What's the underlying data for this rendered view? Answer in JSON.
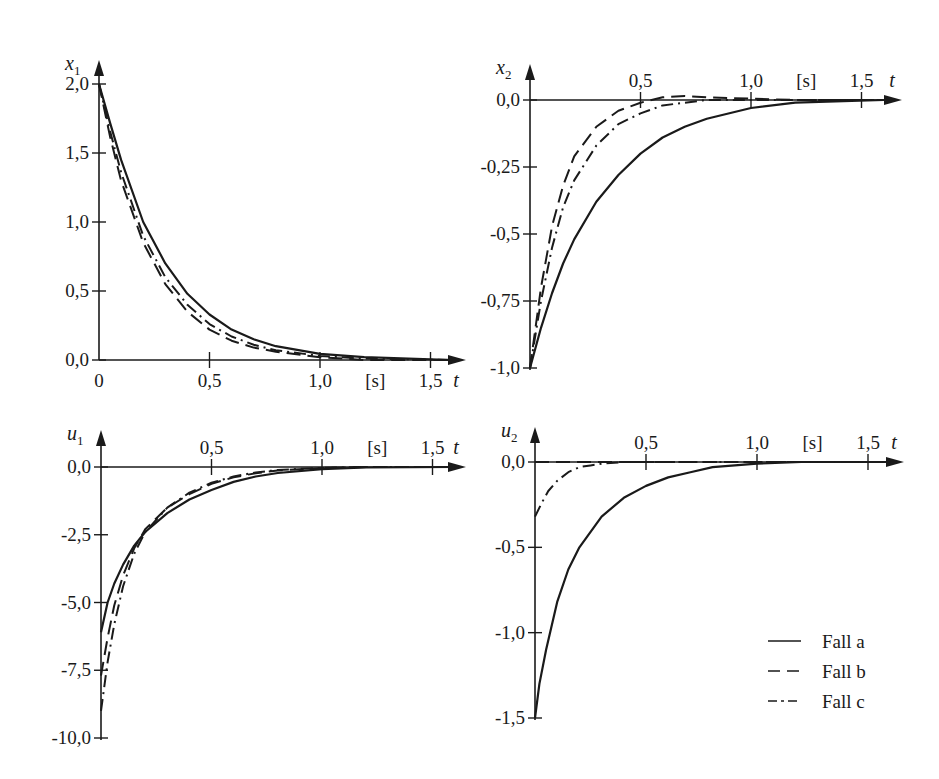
{
  "chart_data": [
    {
      "type": "line",
      "panel": "top-left",
      "ylabel": "x1",
      "ylabel_var": "x",
      "ylabel_sub": "1",
      "xlabel": "t",
      "xunit": "[s]",
      "xlim": [
        0,
        1.6
      ],
      "ylim": [
        0,
        2.0
      ],
      "xticks": [
        "0",
        "0,5",
        "1,0",
        "1,5"
      ],
      "xtick_values": [
        0,
        0.5,
        1.0,
        1.5
      ],
      "yticks": [
        "0,0",
        "0,5",
        "1,0",
        "1,5",
        "2,0"
      ],
      "ytick_values": [
        0,
        0.5,
        1.0,
        1.5,
        2.0
      ],
      "x_tick_labels_position": "below",
      "series": [
        {
          "name": "Fall a",
          "style": "solid",
          "x": [
            0,
            0.05,
            0.1,
            0.2,
            0.3,
            0.4,
            0.5,
            0.6,
            0.7,
            0.8,
            1.0,
            1.2,
            1.6
          ],
          "values": [
            2.0,
            1.72,
            1.45,
            1.0,
            0.7,
            0.48,
            0.33,
            0.22,
            0.15,
            0.1,
            0.045,
            0.02,
            0.0
          ]
        },
        {
          "name": "Fall b",
          "style": "dashed",
          "x": [
            0,
            0.05,
            0.1,
            0.2,
            0.3,
            0.4,
            0.5,
            0.6,
            0.7,
            0.8,
            1.0,
            1.2,
            1.6
          ],
          "values": [
            2.0,
            1.62,
            1.3,
            0.85,
            0.55,
            0.35,
            0.22,
            0.14,
            0.09,
            0.06,
            0.02,
            0.0,
            0.0
          ]
        },
        {
          "name": "Fall c",
          "style": "dash-dot",
          "x": [
            0,
            0.05,
            0.1,
            0.2,
            0.3,
            0.4,
            0.5,
            0.6,
            0.7,
            0.8,
            1.0,
            1.2,
            1.6
          ],
          "values": [
            2.0,
            1.66,
            1.36,
            0.9,
            0.6,
            0.4,
            0.26,
            0.17,
            0.11,
            0.07,
            0.03,
            0.01,
            0.0
          ]
        }
      ]
    },
    {
      "type": "line",
      "panel": "top-right",
      "ylabel": "x2",
      "ylabel_var": "x",
      "ylabel_sub": "2",
      "xlabel": "t",
      "xunit": "[s]",
      "xlim": [
        0,
        1.6
      ],
      "ylim": [
        -1.0,
        0.0
      ],
      "xticks": [
        "0,5",
        "1,0",
        "1,5"
      ],
      "xtick_values": [
        0.5,
        1.0,
        1.5
      ],
      "yticks": [
        "0,0",
        "-0,25",
        "-0,5",
        "-0,75",
        "-1,0"
      ],
      "ytick_values": [
        0,
        -0.25,
        -0.5,
        -0.75,
        -1.0
      ],
      "x_tick_labels_position": "above",
      "series": [
        {
          "name": "Fall a",
          "style": "solid",
          "x": [
            0,
            0.05,
            0.1,
            0.15,
            0.2,
            0.3,
            0.4,
            0.5,
            0.6,
            0.7,
            0.8,
            1.0,
            1.2,
            1.6
          ],
          "values": [
            -1.0,
            -0.85,
            -0.72,
            -0.61,
            -0.52,
            -0.38,
            -0.28,
            -0.2,
            -0.14,
            -0.1,
            -0.07,
            -0.03,
            -0.01,
            0.0
          ]
        },
        {
          "name": "Fall b",
          "style": "dashed",
          "x": [
            0,
            0.05,
            0.1,
            0.15,
            0.2,
            0.3,
            0.4,
            0.5,
            0.6,
            0.7,
            0.8,
            1.0,
            1.2,
            1.6
          ],
          "values": [
            -1.0,
            -0.7,
            -0.47,
            -0.32,
            -0.21,
            -0.1,
            -0.04,
            -0.01,
            0.01,
            0.015,
            0.01,
            0.005,
            0.0,
            0.0
          ]
        },
        {
          "name": "Fall c",
          "style": "dash-dot",
          "x": [
            0,
            0.05,
            0.1,
            0.15,
            0.2,
            0.3,
            0.4,
            0.5,
            0.6,
            0.7,
            0.8,
            1.0,
            1.2,
            1.6
          ],
          "values": [
            -1.0,
            -0.75,
            -0.55,
            -0.4,
            -0.3,
            -0.17,
            -0.09,
            -0.05,
            -0.02,
            -0.01,
            0.0,
            0.0,
            0.0,
            0.0
          ]
        }
      ]
    },
    {
      "type": "line",
      "panel": "bottom-left",
      "ylabel": "u1",
      "ylabel_var": "u",
      "ylabel_sub": "1",
      "xlabel": "t",
      "xunit": "[s]",
      "xlim": [
        0,
        1.6
      ],
      "ylim": [
        -10.0,
        0.0
      ],
      "xticks": [
        "0,5",
        "1,0",
        "1,5"
      ],
      "xtick_values": [
        0.5,
        1.0,
        1.5
      ],
      "yticks": [
        "0,0",
        "-2,5",
        "-5,0",
        "-7,5",
        "-10,0"
      ],
      "ytick_values": [
        0,
        -2.5,
        -5.0,
        -7.5,
        -10.0
      ],
      "x_tick_labels_position": "above",
      "series": [
        {
          "name": "Fall a",
          "style": "solid",
          "x": [
            0,
            0.03,
            0.06,
            0.1,
            0.15,
            0.2,
            0.3,
            0.4,
            0.5,
            0.6,
            0.7,
            0.8,
            1.0,
            1.2,
            1.6
          ],
          "values": [
            -6.1,
            -5.0,
            -4.3,
            -3.6,
            -2.9,
            -2.4,
            -1.7,
            -1.2,
            -0.85,
            -0.55,
            -0.35,
            -0.22,
            -0.08,
            -0.02,
            0.0
          ]
        },
        {
          "name": "Fall b",
          "style": "dashed",
          "x": [
            0,
            0.03,
            0.06,
            0.1,
            0.15,
            0.2,
            0.3,
            0.4,
            0.5,
            0.6,
            0.7,
            0.8,
            1.0,
            1.2,
            1.6
          ],
          "values": [
            -7.7,
            -6.3,
            -5.1,
            -4.0,
            -3.0,
            -2.3,
            -1.5,
            -1.0,
            -0.62,
            -0.38,
            -0.23,
            -0.13,
            -0.04,
            0.0,
            0.0
          ]
        },
        {
          "name": "Fall c",
          "style": "dash-dot",
          "x": [
            0,
            0.03,
            0.06,
            0.1,
            0.15,
            0.2,
            0.3,
            0.4,
            0.5,
            0.6,
            0.7,
            0.8,
            1.0,
            1.2,
            1.6
          ],
          "values": [
            -9.0,
            -7.2,
            -5.8,
            -4.4,
            -3.2,
            -2.4,
            -1.5,
            -0.95,
            -0.58,
            -0.35,
            -0.2,
            -0.11,
            -0.03,
            0.0,
            0.0
          ]
        }
      ]
    },
    {
      "type": "line",
      "panel": "bottom-right",
      "ylabel": "u2",
      "ylabel_var": "u",
      "ylabel_sub": "2",
      "xlabel": "t",
      "xunit": "[s]",
      "xlim": [
        0,
        1.6
      ],
      "ylim": [
        -1.5,
        0.0
      ],
      "xticks": [
        "0,5",
        "1,0",
        "1,5"
      ],
      "xtick_values": [
        0.5,
        1.0,
        1.5
      ],
      "yticks": [
        "0,0",
        "-0,5",
        "-1,0",
        "-1,5"
      ],
      "ytick_values": [
        0,
        -0.5,
        -1.0,
        -1.5
      ],
      "x_tick_labels_position": "above",
      "series": [
        {
          "name": "Fall a",
          "style": "solid",
          "x": [
            0,
            0.02,
            0.05,
            0.1,
            0.15,
            0.2,
            0.3,
            0.4,
            0.5,
            0.6,
            0.7,
            0.8,
            1.0,
            1.2,
            1.6
          ],
          "values": [
            -1.5,
            -1.3,
            -1.1,
            -0.82,
            -0.63,
            -0.5,
            -0.32,
            -0.21,
            -0.14,
            -0.09,
            -0.06,
            -0.03,
            -0.01,
            0.0,
            0.0
          ]
        },
        {
          "name": "Fall b",
          "style": "dashed",
          "x": [
            0,
            0.5,
            1.0,
            1.6
          ],
          "values": [
            0.0,
            0.0,
            0.0,
            0.0
          ]
        },
        {
          "name": "Fall c",
          "style": "dash-dot",
          "x": [
            0,
            0.03,
            0.06,
            0.1,
            0.15,
            0.2,
            0.25,
            0.3,
            0.4,
            0.6,
            1.0,
            1.6
          ],
          "values": [
            -0.32,
            -0.24,
            -0.17,
            -0.11,
            -0.06,
            -0.03,
            -0.02,
            -0.01,
            0.0,
            0.0,
            0.0,
            0.0
          ]
        }
      ]
    }
  ],
  "legend": {
    "position": "bottom-right panel, lower right",
    "items": [
      {
        "label": "Fall a",
        "style": "solid"
      },
      {
        "label": "Fall b",
        "style": "dashed"
      },
      {
        "label": "Fall c",
        "style": "dash-dot"
      }
    ]
  }
}
